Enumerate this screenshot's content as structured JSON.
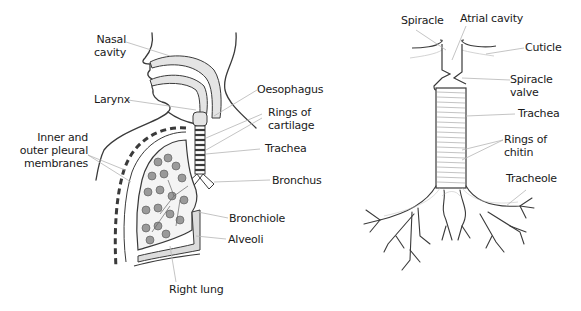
{
  "human_respiratory_system": {
    "labels": {
      "nasal_cavity": [
        "Nasal",
        "cavity"
      ],
      "larynx": "Larynx",
      "pleural_membranes": [
        "Inner and",
        "outer pleural",
        "membranes"
      ],
      "oesophagus": "Oesophagus",
      "rings_of_cartilage": [
        "Rings of",
        "cartilage"
      ],
      "trachea": "Trachea",
      "bronchus": "Bronchus",
      "bronchiole": "Bronchiole",
      "alveoli": "Alveoli",
      "right_lung": "Right lung"
    }
  },
  "insect_tracheal_system": {
    "labels": {
      "spiracle": "Spiracle",
      "atrial_cavity": "Atrial cavity",
      "cuticle": "Cuticle",
      "spiracle_valve": [
        "Spiracle",
        "valve"
      ],
      "trachea": "Trachea",
      "rings_of_chitin": [
        "Rings of",
        "chitin"
      ],
      "tracheole": "Tracheole"
    }
  },
  "colors": {
    "line": "#3a3a3a",
    "leader": "#b5b5b5",
    "fill_light": "#e4e4e4",
    "alveoli_fill": "#9a9a9a"
  }
}
